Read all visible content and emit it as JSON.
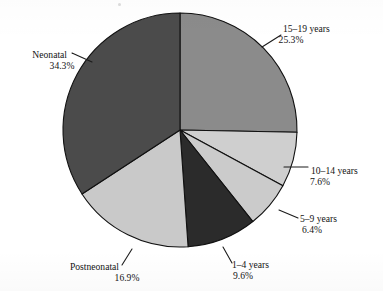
{
  "figure": {
    "background_color": "#ffffff",
    "pie": {
      "center_x": 180,
      "center_y": 130,
      "radius": 117,
      "outline_color": "#111111"
    }
  },
  "chart_data": {
    "type": "pie",
    "title": "",
    "subtitle": "",
    "xlabel": "",
    "ylabel": "",
    "legend_position": "none",
    "grid": false,
    "start_angle_deg": 0,
    "direction": "clockwise",
    "value_unit": "percent",
    "categories": [
      "15–19 years",
      "10–14 years",
      "5–9 years",
      "1–4 years",
      "Postneonatal",
      "Neonatal"
    ],
    "values": [
      25.3,
      7.6,
      6.4,
      9.6,
      16.9,
      34.3
    ],
    "slices": [
      {
        "label": "15–19 years",
        "value": 25.3,
        "value_text": "25.3%",
        "color": "#8b8b8b",
        "start_deg": 0.0,
        "end_deg": 91.08,
        "label_x": 283,
        "label_y": 32,
        "pct_x": 291,
        "pct_y": 43,
        "label_anchor": "start",
        "leader": "M 262 47 L 281 35"
      },
      {
        "label": "10–14 years",
        "value": 7.6,
        "value_text": "7.6%",
        "color": "#cfcfcf",
        "start_deg": 91.08,
        "end_deg": 118.44,
        "label_x": 311,
        "label_y": 174,
        "pct_x": 320,
        "pct_y": 185,
        "label_anchor": "start",
        "leader": "M 284 167 L 308 167"
      },
      {
        "label": "5–9 years",
        "value": 6.4,
        "value_text": "6.4%",
        "color": "#cbcbcb",
        "start_deg": 118.44,
        "end_deg": 141.48,
        "label_x": 300,
        "label_y": 222,
        "pct_x": 312,
        "pct_y": 233,
        "label_anchor": "start",
        "leader": "M 279 210 L 298 218"
      },
      {
        "label": "1–4 years",
        "value": 9.6,
        "value_text": "9.6%",
        "color": "#2b2b2b",
        "start_deg": 141.48,
        "end_deg": 176.04,
        "label_x": 232,
        "label_y": 268,
        "pct_x": 243,
        "pct_y": 279,
        "label_anchor": "start",
        "leader": "M 223 247 L 232 263"
      },
      {
        "label": "Postneonatal",
        "value": 16.9,
        "value_text": "16.9%",
        "color": "#c9c9c9",
        "start_deg": 176.04,
        "end_deg": 236.88,
        "label_x": 119,
        "label_y": 270,
        "pct_x": 127,
        "pct_y": 281,
        "label_anchor": "end",
        "leader": "M 132 249 L 122 265"
      },
      {
        "label": "Neonatal",
        "value": 34.3,
        "value_text": "34.3%",
        "color": "#4b4b4b",
        "start_deg": 236.88,
        "end_deg": 360.0,
        "label_x": 67,
        "label_y": 58,
        "pct_x": 62,
        "pct_y": 69,
        "label_anchor": "end",
        "leader": "M 72 53 L 92 62"
      }
    ]
  }
}
